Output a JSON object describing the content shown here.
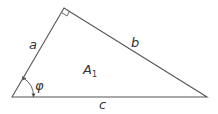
{
  "diagram": {
    "type": "right-triangle",
    "stroke_color": "#555555",
    "vertices": {
      "left": [
        12,
        97
      ],
      "top": [
        64,
        8
      ],
      "right": [
        207,
        97
      ]
    },
    "right_angle_at": "top",
    "labels": {
      "side_a": "a",
      "side_b": "b",
      "side_c": "c",
      "area": "A",
      "area_subscript": "1",
      "angle": "φ"
    }
  }
}
